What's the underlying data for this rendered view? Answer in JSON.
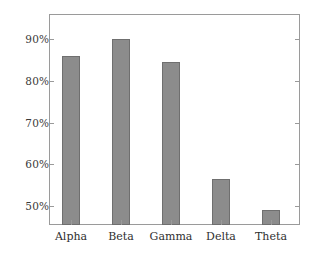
{
  "chart_data": {
    "type": "bar",
    "title": "",
    "xlabel": "",
    "ylabel": "",
    "categories": [
      "Alpha",
      "Beta",
      "Gamma",
      "Delta",
      "Theta"
    ],
    "values": [
      86,
      90,
      84.5,
      56.5,
      49
    ],
    "value_unit": "percent",
    "ytick_labels": [
      "50%",
      "60%",
      "70%",
      "80%",
      "90%"
    ],
    "ytick_values": [
      50,
      60,
      70,
      80,
      90
    ],
    "ylim": [
      45.5,
      95.5
    ],
    "grid": false,
    "legend": false,
    "legend_position": "none",
    "series": [
      {
        "name": "",
        "values": [
          86,
          90,
          84.5,
          56.5,
          49
        ]
      }
    ],
    "colors": {
      "bar_fill": "#8c8c8c",
      "bar_border": "#6f6f6f",
      "axis_line": "#9a9a9a",
      "tick_label": "#333333",
      "background": "#ffffff"
    }
  }
}
